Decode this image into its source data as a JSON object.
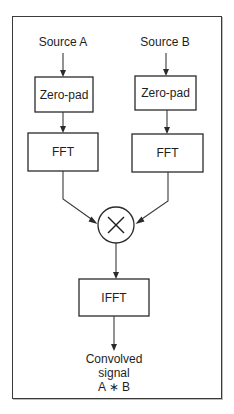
{
  "diagram": {
    "title": "",
    "sources": [
      {
        "id": "source-a",
        "label": "Source A"
      },
      {
        "id": "source-b",
        "label": "Source B"
      }
    ],
    "nodes": {
      "zeropad_a": {
        "label": "Zero-pad"
      },
      "zeropad_b": {
        "label": "Zero-pad"
      },
      "fft_a": {
        "label": "FFT"
      },
      "fft_b": {
        "label": "FFT"
      },
      "multiply": {
        "symbol": "×",
        "meaning": "multiply"
      },
      "ifft": {
        "label": "IFFT"
      }
    },
    "output": {
      "lines": [
        "Convolved",
        "signal",
        "A ∗ B"
      ]
    },
    "edges": [
      {
        "from": "Source A",
        "to": "Zero-pad (A)"
      },
      {
        "from": "Source B",
        "to": "Zero-pad (B)"
      },
      {
        "from": "Zero-pad (A)",
        "to": "FFT (A)"
      },
      {
        "from": "Zero-pad (B)",
        "to": "FFT (B)"
      },
      {
        "from": "FFT (A)",
        "to": "×"
      },
      {
        "from": "FFT (B)",
        "to": "×"
      },
      {
        "from": "×",
        "to": "IFFT"
      },
      {
        "from": "IFFT",
        "to": "Convolved signal A ∗ B"
      }
    ],
    "colors": {
      "stroke": "#2a2a2a",
      "text": "#1e1e1e",
      "background": "#ffffff"
    }
  }
}
